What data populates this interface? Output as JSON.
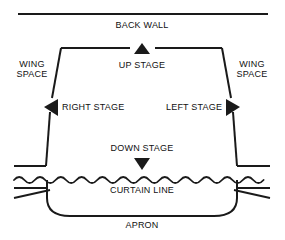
{
  "diagram": {
    "type": "stage-plan",
    "background_color": "#ffffff",
    "line_color": "#1a1a1a",
    "text_color": "#111111",
    "labels": {
      "back_wall": "BACK WALL",
      "wing_space_left": "WING\nSPACE",
      "wing_space_right": "WING\nSPACE",
      "up_stage": "UP STAGE",
      "right_stage": "RIGHT STAGE",
      "left_stage": "LEFT STAGE",
      "down_stage": "DOWN STAGE",
      "curtain_line": "CURTAIN LINE",
      "apron": "APRON"
    },
    "markers": {
      "up_arrow": "triangle-up",
      "down_arrow": "triangle-down",
      "right_stage_arrow": "triangle-left",
      "left_stage_arrow": "triangle-right"
    },
    "features": {
      "back_wall_line": "horizontal-rule",
      "stage_outline": "trapezoid",
      "curtain_line_style": "wavy",
      "apron_shape": "rounded-bottom"
    }
  }
}
